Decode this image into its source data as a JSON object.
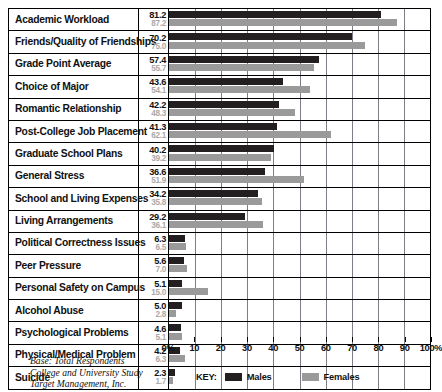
{
  "chart_data": {
    "type": "bar",
    "orientation": "horizontal",
    "title": "",
    "xlabel": "",
    "ylabel": "",
    "xlim": [
      0,
      100
    ],
    "grid": true,
    "legend_position": "bottom",
    "categories": [
      "Academic Workload",
      "Friends/Quality of Friendships",
      "Grade Point Average",
      "Choice of Major",
      "Romantic Relationship",
      "Post-College Job Placement",
      "Graduate School Plans",
      "General Stress",
      "School and Living Expenses",
      "Living Arrangements",
      "Political Correctness Issues",
      "Peer Pressure",
      "Personal Safety on Campus",
      "Alcohol Abuse",
      "Psychological Problems",
      "Physical/Medical Problem",
      "Suicide"
    ],
    "series": [
      {
        "name": "Males",
        "color": "#231f20",
        "values": [
          81.2,
          70.2,
          57.4,
          43.6,
          42.2,
          41.3,
          40.2,
          36.6,
          34.2,
          29.2,
          6.3,
          5.6,
          5.1,
          5.0,
          4.6,
          4.2,
          2.3
        ]
      },
      {
        "name": "Females",
        "color": "#9a9a9a",
        "values": [
          87.2,
          75.0,
          55.7,
          54.1,
          48.3,
          62.1,
          39.2,
          51.9,
          35.8,
          36.1,
          6.5,
          7.0,
          15.0,
          2.8,
          5.1,
          6.3,
          1.7
        ]
      }
    ],
    "xticks": [
      0,
      10,
      20,
      30,
      40,
      50,
      60,
      70,
      80,
      90,
      100
    ],
    "xticklabels": [
      "0%",
      "10",
      "20",
      "30",
      "40",
      "50",
      "60",
      "70",
      "80",
      "90",
      "100%"
    ]
  },
  "value_labels": {
    "males": [
      "81.2",
      "70.2",
      "57.4",
      "43.6",
      "42.2",
      "41.3",
      "40.2",
      "36.6",
      "34.2",
      "29.2",
      "6.3",
      "5.6",
      "5.1",
      "5.0",
      "4.6",
      "4.2",
      "2.3"
    ],
    "females": [
      "87.2",
      "75.0",
      "55.7",
      "54.1",
      "48.3",
      "62.1",
      "39.2",
      "51.9",
      "35.8",
      "36.1",
      "6.5",
      "7.0",
      "15.0",
      "2.8",
      "5.1",
      "6.3",
      "1.7"
    ]
  },
  "legend": {
    "key_label": "KEY:",
    "males_label": "Males",
    "females_label": "Females",
    "males_color": "#231f20",
    "females_color": "#9a9a9a"
  },
  "footer": {
    "line1": "Base: Total Respondents",
    "line2": "College and University Study",
    "line3": "Target Management, Inc."
  }
}
